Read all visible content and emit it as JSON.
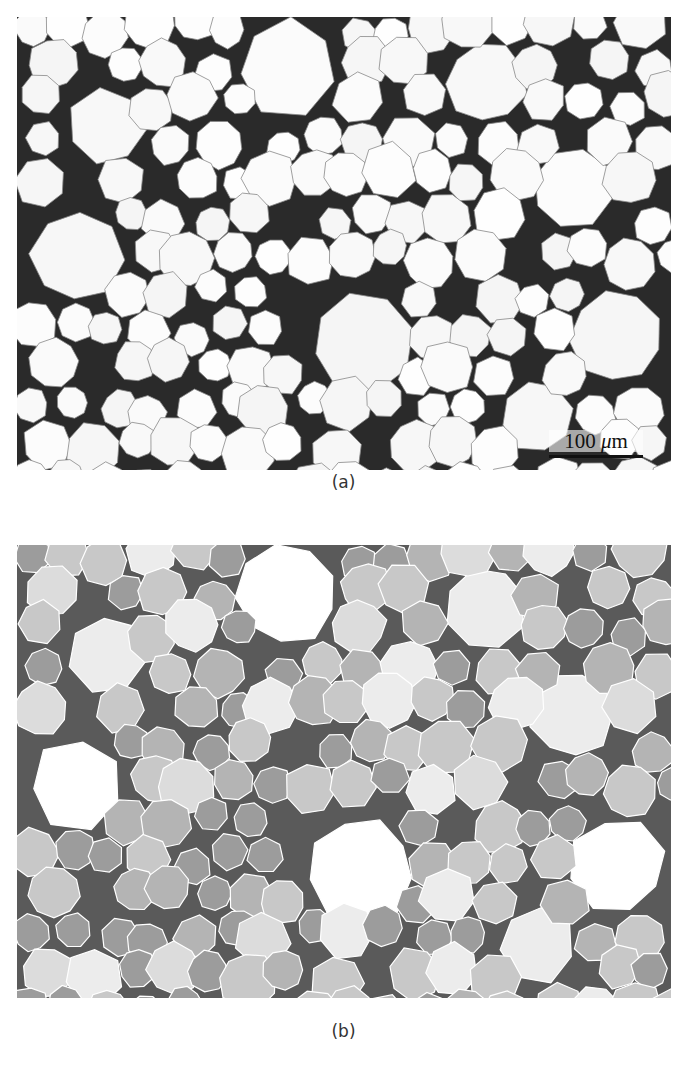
{
  "figure": {
    "panels": [
      {
        "id": "a",
        "caption": "(a)",
        "description": "Optical micrograph of closed-cell foam structure with dark cell walls",
        "scale_bar": {
          "value": "100",
          "unit_symbol": "μ",
          "unit_suffix": "m",
          "label": "100 μm"
        }
      },
      {
        "id": "b",
        "caption": "(b)",
        "description": "Segmented cell map with cells shaded in gray levels by size, white boundaries"
      }
    ]
  },
  "colors": {
    "panel_a_background": "#fbfbfb",
    "panel_a_cell_wall": "#1e1e1e",
    "panel_b_cell_shades": [
      "#ffffff",
      "#ececec",
      "#dcdcdc",
      "#c8c8c8",
      "#b4b4b4",
      "#9c9c9c",
      "#5a5a5a"
    ],
    "panel_b_boundary": "#ffffff"
  }
}
